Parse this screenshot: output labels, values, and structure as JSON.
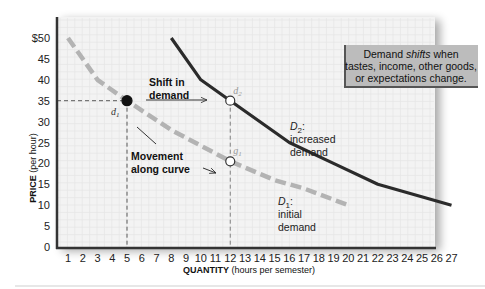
{
  "chart_data": {
    "type": "line",
    "title": "",
    "xlabel": "QUANTITY",
    "xlabel_unit": "(hours per semester)",
    "ylabel": "PRICE",
    "ylabel_unit": "(per hour)",
    "xlim": [
      0,
      27
    ],
    "ylim": [
      0,
      50
    ],
    "x_ticks": [
      1,
      2,
      3,
      4,
      5,
      6,
      7,
      8,
      9,
      10,
      11,
      12,
      13,
      14,
      15,
      16,
      17,
      18,
      19,
      20,
      21,
      22,
      23,
      24,
      25,
      26,
      27
    ],
    "y_ticks": [
      {
        "value": 0,
        "label": "0"
      },
      {
        "value": 5,
        "label": "5"
      },
      {
        "value": 10,
        "label": "10"
      },
      {
        "value": 15,
        "label": "15"
      },
      {
        "value": 20,
        "label": "20"
      },
      {
        "value": 25,
        "label": "25"
      },
      {
        "value": 30,
        "label": "30"
      },
      {
        "value": 35,
        "label": "35"
      },
      {
        "value": 40,
        "label": "40"
      },
      {
        "value": 45,
        "label": "45"
      },
      {
        "value": 50,
        "label": "$50"
      }
    ],
    "grid": true,
    "series": [
      {
        "name": "D1",
        "style": "dashed",
        "color": "#b3b3b3",
        "points": [
          [
            1,
            50
          ],
          [
            3,
            40
          ],
          [
            5,
            35
          ],
          [
            8,
            28
          ],
          [
            12,
            20.5
          ],
          [
            15,
            16
          ],
          [
            17,
            14
          ],
          [
            20,
            10
          ]
        ]
      },
      {
        "name": "D2",
        "style": "solid",
        "color": "#2b2b2b",
        "points": [
          [
            8,
            50
          ],
          [
            10,
            40
          ],
          [
            12,
            35
          ],
          [
            16,
            25
          ],
          [
            19,
            20
          ],
          [
            22,
            15
          ],
          [
            27,
            10
          ]
        ]
      }
    ],
    "points": [
      {
        "name": "d1",
        "label": "d",
        "sub": "1",
        "x": 5,
        "y": 35,
        "filled": true
      },
      {
        "name": "d2",
        "label": "d",
        "sub": "2",
        "x": 12,
        "y": 35,
        "filled": false
      },
      {
        "name": "g1",
        "label": "g",
        "sub": "1",
        "x": 12,
        "y": 20.5,
        "filled": false
      }
    ],
    "curve_labels": [
      {
        "name": "D2",
        "title": "D",
        "sub": "2",
        "lines": [
          "increased",
          "demand"
        ]
      },
      {
        "name": "D1",
        "title": "D",
        "sub": "1",
        "lines": [
          "initial",
          "demand"
        ]
      }
    ],
    "annotations": {
      "shift": [
        "Shift in",
        "demand"
      ],
      "movement": [
        "Movement",
        "along curve"
      ]
    },
    "callout": {
      "line1_pre": "Demand ",
      "line1_italic": "shifts",
      "line1_post": " when",
      "line2": "tastes, income, other goods,",
      "line3": "or expectations change."
    }
  },
  "colors": {
    "grid": "#e6e6e6",
    "plot_bg": "#f2f2f2",
    "axis": "#333333",
    "callout_bg": "#b9b9b9",
    "callout_border": "#555555",
    "d1": "#b3b3b3",
    "d2": "#2b2b2b"
  }
}
